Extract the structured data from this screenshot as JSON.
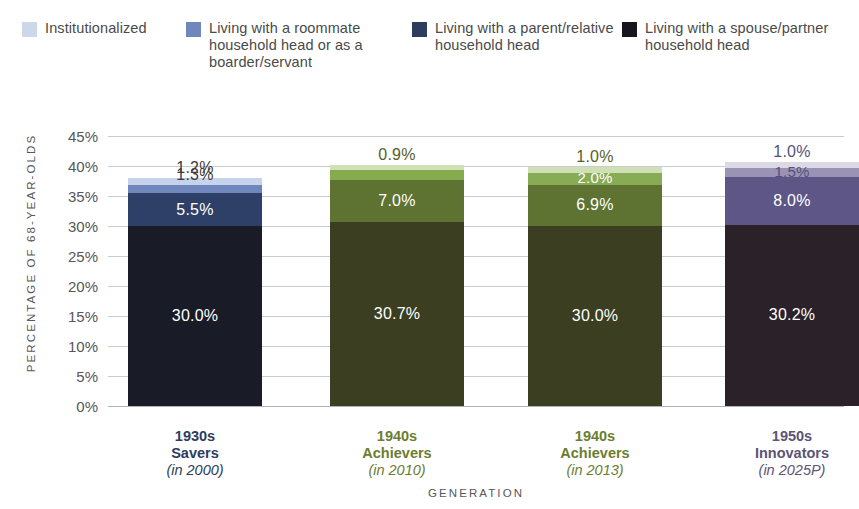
{
  "chart_data": {
    "type": "bar",
    "subtype": "stacked-bar",
    "title": "",
    "xlabel": "GENERATION",
    "ylabel": "PERCENTAGE OF 68-YEAR-OLDS",
    "ylim": [
      0,
      45
    ],
    "ytick_step": 5,
    "ytick_labels": [
      "45%",
      "40%",
      "35%",
      "30%",
      "25%",
      "20%",
      "15%",
      "10%",
      "5%",
      "0%"
    ],
    "ytick_values": [
      45,
      40,
      35,
      30,
      25,
      20,
      15,
      10,
      5,
      0
    ],
    "grid": true,
    "legend_position": "top",
    "categories": [
      "1930s Savers (in 2000)",
      "1940s Achievers (in 2010)",
      "1940s Achievers (in 2013)",
      "1950s Innovators (in 2025P)"
    ],
    "series": [
      {
        "name": "Living with a spouse/partner household head",
        "values": [
          30.0,
          30.7,
          30.0,
          30.2
        ],
        "labels": [
          "30.0%",
          "30.7%",
          "30.0%",
          "30.2%"
        ]
      },
      {
        "name": "Living with a parent/relative household head",
        "values": [
          5.5,
          7.0,
          6.9,
          8.0
        ],
        "labels": [
          "5.5%",
          "7.0%",
          "6.9%",
          "8.0%"
        ]
      },
      {
        "name": "Living with a roommate household head or as a boarder/servant",
        "values": [
          1.3,
          1.6,
          2.0,
          1.5
        ],
        "labels": [
          "1.3%",
          "1.6%",
          "2.0%",
          "1.5%"
        ]
      },
      {
        "name": "Institutionalized",
        "values": [
          1.2,
          0.9,
          1.0,
          1.0
        ],
        "labels": [
          "1.2%",
          "0.9%",
          "1.0%",
          "1.0%"
        ]
      }
    ],
    "totals": [
      38.0,
      40.2,
      39.9,
      40.7
    ]
  },
  "legend": {
    "items": [
      {
        "label": "Institutionalized",
        "color": "#cdd7ea"
      },
      {
        "label": "Living with a roommate household head or as a boarder/servant",
        "color": "#6f87bd"
      },
      {
        "label": "Living with a parent/relative household head",
        "color": "#2c3d5e"
      },
      {
        "label": "Living with a spouse/partner household head",
        "color": "#15161f"
      }
    ]
  },
  "axes": {
    "y_title": "PERCENTAGE OF 68-YEAR-OLDS",
    "x_title": "GENERATION",
    "y_ticks": [
      "45%",
      "40%",
      "35%",
      "30%",
      "25%",
      "20%",
      "15%",
      "10%",
      "5%",
      "0%"
    ]
  },
  "bars": [
    {
      "id": "bar-1930s-savers",
      "label_line1": "1930s",
      "label_line2": "Savers",
      "label_line3": "(in 2000)",
      "label_color": "#2c3d5e",
      "segments": [
        {
          "name": "spouse",
          "label": "30.0%",
          "value": 30.0,
          "color": "#191b27",
          "text_color": "#ffffff",
          "label_placement": "inside"
        },
        {
          "name": "parent",
          "label": "5.5%",
          "value": 5.5,
          "color": "#2f4068",
          "text_color": "#ffffff",
          "label_placement": "inside"
        },
        {
          "name": "roommate",
          "label": "1.3%",
          "value": 1.3,
          "color": "#6f87bd",
          "text_color": "#3c3c3c",
          "label_placement": "above"
        },
        {
          "name": "institutionalized",
          "label": "1.2%",
          "value": 1.2,
          "color": "#c6d3ea",
          "text_color": "#3c3c3c",
          "label_placement": "above"
        }
      ]
    },
    {
      "id": "bar-1940s-achievers-2010",
      "label_line1": "1940s",
      "label_line2": "Achievers",
      "label_line3": "(in 2010)",
      "label_color": "#6c7d30",
      "segments": [
        {
          "name": "spouse",
          "label": "30.7%",
          "value": 30.7,
          "color": "#3b3e20",
          "text_color": "#ffffff",
          "label_placement": "inside"
        },
        {
          "name": "parent",
          "label": "7.0%",
          "value": 7.0,
          "color": "#5e7231",
          "text_color": "#ffffff",
          "label_placement": "inside"
        },
        {
          "name": "roommate",
          "label": "1.6%",
          "value": 1.6,
          "color": "#86ab4f",
          "text_color": "#ffffff",
          "label_placement": "above"
        },
        {
          "name": "institutionalized",
          "label": "0.9%",
          "value": 0.9,
          "color": "#cfe0b4",
          "text_color": "#54612a",
          "label_placement": "above"
        }
      ]
    },
    {
      "id": "bar-1940s-achievers-2013",
      "label_line1": "1940s",
      "label_line2": "Achievers",
      "label_line3": "(in 2013)",
      "label_color": "#6c7d30",
      "segments": [
        {
          "name": "spouse",
          "label": "30.0%",
          "value": 30.0,
          "color": "#3b3e20",
          "text_color": "#ffffff",
          "label_placement": "inside"
        },
        {
          "name": "parent",
          "label": "6.9%",
          "value": 6.9,
          "color": "#5e7231",
          "text_color": "#ffffff",
          "label_placement": "inside"
        },
        {
          "name": "roommate",
          "label": "2.0%",
          "value": 2.0,
          "color": "#88ab56",
          "text_color": "#ffffff",
          "label_placement": "inside-small"
        },
        {
          "name": "institutionalized",
          "label": "1.0%",
          "value": 1.0,
          "color": "#cfe0b4",
          "text_color": "#54612a",
          "label_placement": "above"
        }
      ]
    },
    {
      "id": "bar-1950s-innovators",
      "label_line1": "1950s",
      "label_line2": "Innovators",
      "label_line3": "(in 2025P)",
      "label_color": "#5d5476",
      "segments": [
        {
          "name": "spouse",
          "label": "30.2%",
          "value": 30.2,
          "color": "#2a2129",
          "text_color": "#ffffff",
          "label_placement": "inside"
        },
        {
          "name": "parent",
          "label": "8.0%",
          "value": 8.0,
          "color": "#5e5687",
          "text_color": "#ffffff",
          "label_placement": "inside"
        },
        {
          "name": "roommate",
          "label": "1.5%",
          "value": 1.5,
          "color": "#9a93b6",
          "text_color": "#55507a",
          "label_placement": "inside-small"
        },
        {
          "name": "institutionalized",
          "label": "1.0%",
          "value": 1.0,
          "color": "#ddd8e5",
          "text_color": "#55507a",
          "label_placement": "above"
        }
      ]
    }
  ]
}
